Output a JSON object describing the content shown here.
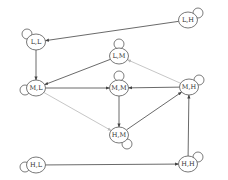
{
  "diagram": {
    "type": "state-transition-graph",
    "colors": {
      "edge": "#444444",
      "edge_light": "#b8b8b8",
      "node_stroke": "#555555",
      "node_fill": "#ffffff"
    },
    "nodes": [
      {
        "id": "LH",
        "label": "L,H",
        "x": 188,
        "y": 20,
        "loop": "right-top"
      },
      {
        "id": "LL",
        "label": "L,L",
        "x": 36,
        "y": 42,
        "loop": "left-top"
      },
      {
        "id": "LM",
        "label": "L,M",
        "x": 119,
        "y": 56,
        "loop": "top"
      },
      {
        "id": "ML",
        "label": "M,L",
        "x": 36,
        "y": 88,
        "loop": "left"
      },
      {
        "id": "MM",
        "label": "M,M",
        "x": 119,
        "y": 88,
        "loop": "top"
      },
      {
        "id": "MH",
        "label": "M,H",
        "x": 189,
        "y": 87,
        "loop": "right-top"
      },
      {
        "id": "HM",
        "label": "H,M",
        "x": 119,
        "y": 135,
        "loop": "bottom-right"
      },
      {
        "id": "HL",
        "label": "H,L",
        "x": 36,
        "y": 165,
        "loop": "left"
      },
      {
        "id": "HH",
        "label": "H,H",
        "x": 188,
        "y": 164,
        "loop": "right-top"
      }
    ],
    "edges": [
      {
        "from": "LH",
        "to": "LL",
        "style": "dark"
      },
      {
        "from": "LL",
        "to": "ML",
        "style": "dark"
      },
      {
        "from": "LM",
        "to": "ML",
        "style": "dark"
      },
      {
        "from": "ML",
        "to": "MM",
        "style": "dark"
      },
      {
        "from": "MH",
        "to": "MM",
        "style": "dark"
      },
      {
        "from": "MH",
        "to": "LM",
        "style": "light"
      },
      {
        "from": "ML",
        "to": "HM",
        "style": "light"
      },
      {
        "from": "MM",
        "to": "HM",
        "style": "dark"
      },
      {
        "from": "HM",
        "to": "MH",
        "style": "dark"
      },
      {
        "from": "HL",
        "to": "HH",
        "style": "dark"
      },
      {
        "from": "HH",
        "to": "MH",
        "style": "dark"
      }
    ]
  }
}
